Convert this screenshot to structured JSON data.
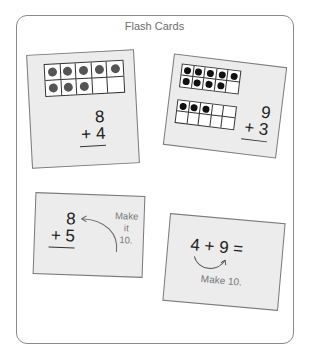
{
  "title": "Flash Cards",
  "colors": {
    "card_fill": "#ececec",
    "card_border": "#7a7a7a",
    "dot_gray": "#555555",
    "dot_black": "#111111",
    "hint_text": "#777777",
    "frame_border": "#8a8a8a"
  },
  "cards": [
    {
      "id": "card-1",
      "ten_frames": [
        {
          "filled": 8,
          "dot_style": "gray"
        }
      ],
      "problem": {
        "top": "8",
        "bottom": "+ 4"
      }
    },
    {
      "id": "card-2",
      "ten_frames": [
        {
          "filled": 9,
          "dot_style": "black"
        },
        {
          "filled": 3,
          "dot_style": "black"
        }
      ],
      "problem": {
        "top": "9",
        "bottom": "+ 3"
      }
    },
    {
      "id": "card-3",
      "problem": {
        "top": "8",
        "bottom": "+ 5"
      },
      "hint": {
        "line1": "Make",
        "line2": "it",
        "line3": "10."
      }
    },
    {
      "id": "card-4",
      "equation": "4 + 9 =",
      "hint": "Make 10."
    }
  ]
}
